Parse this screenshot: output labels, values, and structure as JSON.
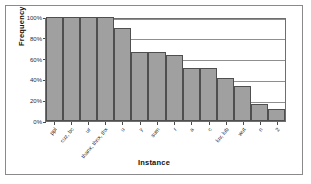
{
  "chart_data": {
    "type": "bar",
    "title": "",
    "xlabel": "Instance",
    "ylabel": "Frequency",
    "categories": [
      "ppl",
      "cuz, bc",
      "ur",
      "thanx, thnx, thx",
      "u",
      "y",
      "sum",
      "r",
      "a",
      "c",
      "luv, lub",
      "wut",
      "n",
      "2"
    ],
    "values": [
      100,
      100,
      100,
      100,
      89,
      66,
      66,
      63,
      51,
      51,
      41,
      34,
      16,
      12
    ],
    "ylim": [
      0,
      100
    ],
    "ytick_labels": [
      "0%",
      "20%",
      "40%",
      "60%",
      "80%",
      "100%"
    ],
    "ytick_values": [
      0,
      20,
      40,
      60,
      80,
      100
    ],
    "grid": true,
    "legend": "none",
    "value_format": "percent"
  },
  "style": {
    "bar_fill": "#a0a0a0",
    "bar_border": "#4f4f4f",
    "gridline": "#8f8f8f",
    "axis": "#6e6e6e",
    "frame": "#8a8a8a",
    "text": "#222222"
  }
}
